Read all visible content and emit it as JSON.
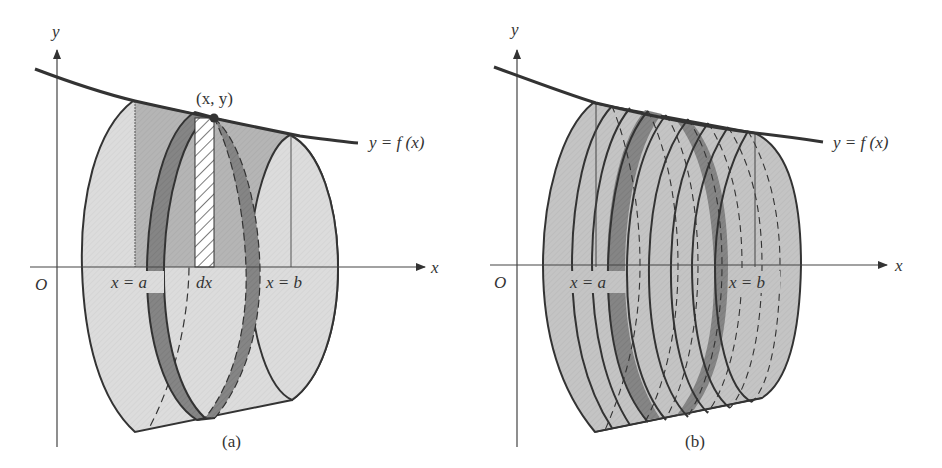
{
  "figure": {
    "colors": {
      "light_fill": "#d9d9d9",
      "mid_fill": "#b3b3b3",
      "dark_fill": "#7f7f7f",
      "stroke": "#333333",
      "background": "#ffffff"
    },
    "panel_a": {
      "caption": "(a)",
      "axis_x_label": "x",
      "axis_y_label": "y",
      "origin_label": "O",
      "curve_label": "y = f (x)",
      "point_label": "(x, y)",
      "left_bound_label": "x = a",
      "right_bound_label": "x = b",
      "strip_label": "dx"
    },
    "panel_b": {
      "caption": "(b)",
      "axis_x_label": "x",
      "axis_y_label": "y",
      "origin_label": "O",
      "curve_label": "y = f (x)",
      "left_bound_label": "x = a",
      "right_bound_label": "x = b",
      "disk_count": 8
    }
  }
}
